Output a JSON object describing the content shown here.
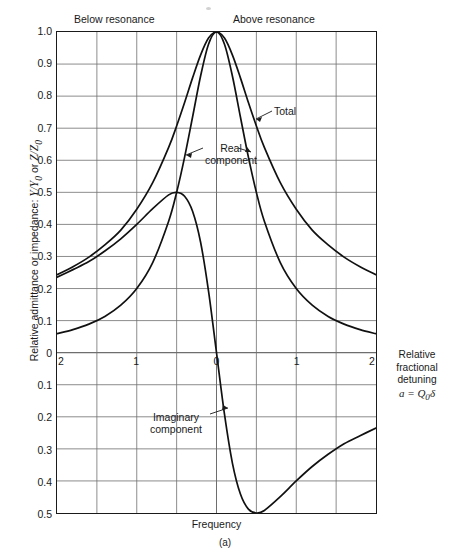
{
  "chart_data": {
    "type": "line",
    "title": "",
    "caption": "(a)",
    "xlabel": "Frequency",
    "ylabel": "Relative admittance or impedance: Y/Y0 or Z/Z0",
    "right_axis_label_lines": [
      "Relative",
      "fractional",
      "detuning"
    ],
    "right_axis_formula": "a = Q0δ",
    "xlim": [
      -2,
      2
    ],
    "ylim": [
      -0.5,
      1.0
    ],
    "grid": true,
    "x_tick_values": [
      -2,
      -1,
      0,
      1,
      2
    ],
    "x_tick_labels": [
      "2",
      "1",
      "0",
      "1",
      "2"
    ],
    "x_minor_gridlines": [
      -1.5,
      -0.5,
      0.5,
      1.5
    ],
    "y_tick_values": [
      1.0,
      0.9,
      0.8,
      0.7,
      0.6,
      0.5,
      0.4,
      0.3,
      0.2,
      0.1,
      0,
      -0.1,
      -0.2,
      -0.3,
      -0.4,
      -0.5
    ],
    "y_tick_labels": [
      "1.0",
      "0.9",
      "0.8",
      "0.7",
      "0.6",
      "0.5",
      "0.4",
      "0.3",
      "0.2",
      "0.1",
      "0",
      "0.1",
      "0.2",
      "0.3",
      "0.4",
      "0.5"
    ],
    "region_labels": {
      "left": "Below resonance",
      "right": "Above resonance"
    },
    "legend_position": "inline-annotations",
    "series": [
      {
        "name": "Total",
        "annotation": "Total",
        "formula": "1 / sqrt(1 + 4a^2)",
        "x": [
          -2,
          -1.8,
          -1.6,
          -1.4,
          -1.2,
          -1,
          -0.8,
          -0.6,
          -0.5,
          -0.4,
          -0.3,
          -0.2,
          -0.1,
          0,
          0.1,
          0.2,
          0.3,
          0.4,
          0.5,
          0.6,
          0.8,
          1,
          1.2,
          1.4,
          1.6,
          1.8,
          2
        ],
        "values": [
          0.243,
          0.268,
          0.298,
          0.336,
          0.382,
          0.447,
          0.53,
          0.64,
          0.707,
          0.78,
          0.857,
          0.928,
          0.981,
          1.0,
          0.981,
          0.928,
          0.857,
          0.78,
          0.707,
          0.64,
          0.53,
          0.447,
          0.382,
          0.336,
          0.298,
          0.268,
          0.243
        ]
      },
      {
        "name": "Real component",
        "annotation": "Real\ncomponent",
        "formula": "1 / (1 + 4a^2)",
        "x": [
          -2,
          -1.8,
          -1.6,
          -1.4,
          -1.2,
          -1,
          -0.8,
          -0.6,
          -0.5,
          -0.4,
          -0.3,
          -0.2,
          -0.1,
          0,
          0.1,
          0.2,
          0.3,
          0.4,
          0.5,
          0.6,
          0.8,
          1,
          1.2,
          1.4,
          1.6,
          1.8,
          2
        ],
        "values": [
          0.059,
          0.072,
          0.089,
          0.113,
          0.148,
          0.2,
          0.281,
          0.41,
          0.5,
          0.61,
          0.735,
          0.862,
          0.962,
          1.0,
          0.962,
          0.862,
          0.735,
          0.61,
          0.5,
          0.41,
          0.281,
          0.2,
          0.148,
          0.113,
          0.089,
          0.072,
          0.059
        ]
      },
      {
        "name": "Imaginary component",
        "annotation": "Imaginary\ncomponent",
        "formula": "-2a / (1 + 4a^2)",
        "x": [
          -2,
          -1.8,
          -1.6,
          -1.4,
          -1.2,
          -1,
          -0.8,
          -0.6,
          -0.5,
          -0.4,
          -0.3,
          -0.2,
          -0.1,
          0,
          0.1,
          0.2,
          0.3,
          0.4,
          0.5,
          0.6,
          0.8,
          1,
          1.2,
          1.4,
          1.6,
          1.8,
          2
        ],
        "values": [
          0.235,
          0.259,
          0.284,
          0.317,
          0.355,
          0.4,
          0.449,
          0.492,
          0.5,
          0.488,
          0.441,
          0.345,
          0.192,
          0.0,
          -0.192,
          -0.345,
          -0.441,
          -0.488,
          -0.5,
          -0.492,
          -0.449,
          -0.4,
          -0.355,
          -0.317,
          -0.284,
          -0.259,
          -0.235
        ]
      }
    ]
  },
  "annotations": {
    "total": "Total",
    "real_line1": "Real",
    "real_line2": "component",
    "imag_line1": "Imaginary",
    "imag_line2": "component"
  },
  "axis": {
    "y_title_prefix": "Relative admittance or impedance: ",
    "y_title_symbol1": "Y/Y",
    "y_title_sub1": "0",
    "y_title_mid": " or ",
    "y_title_symbol2": "Z/Z",
    "y_title_sub2": "0",
    "x_title": "Frequency",
    "right_line1": "Relative",
    "right_line2": "fractional",
    "right_line3": "detuning",
    "right_formula_var": "a",
    "right_formula_eq": " = ",
    "right_formula_q": "Q",
    "right_formula_sub": "0",
    "right_formula_delta": "δ"
  },
  "regions": {
    "below": "Below resonance",
    "above": "Above resonance"
  },
  "caption": "(a)",
  "colors": {
    "curve": "#111111",
    "grid": "#6e6e6e",
    "frame": "#1a1a1a",
    "text": "#1a1a1a",
    "background": "#ffffff"
  }
}
